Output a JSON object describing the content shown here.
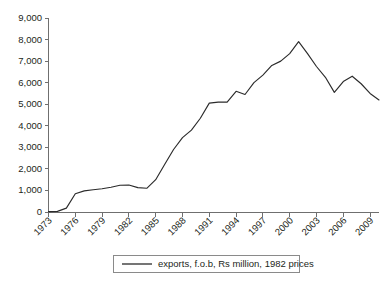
{
  "chart_data": {
    "type": "line",
    "title": "",
    "subtitle": "",
    "xlabel": "",
    "ylabel": "",
    "grid": false,
    "legend_position": "bottom",
    "xlim": [
      1973,
      2010
    ],
    "ylim": [
      0,
      9000
    ],
    "ytick_step": 1000,
    "ytick_labels": [
      "0",
      "1,000",
      "2,000",
      "3,000",
      "4,000",
      "5,000",
      "6,000",
      "7,000",
      "8,000",
      "9,000"
    ],
    "ytick_values": [
      0,
      1000,
      2000,
      3000,
      4000,
      5000,
      6000,
      7000,
      8000,
      9000
    ],
    "xtick_labels": [
      "1973",
      "1976",
      "1979",
      "1982",
      "1985",
      "1988",
      "1991",
      "1994",
      "1997",
      "2000",
      "2003",
      "2006",
      "2009"
    ],
    "xtick_values": [
      1973,
      1976,
      1979,
      1982,
      1985,
      1988,
      1991,
      1994,
      1997,
      2000,
      2003,
      2006,
      2009
    ],
    "series": [
      {
        "name": "exports, f.o.b, Rs million, 1982 prices",
        "color": "#2b2b2b",
        "x": [
          1973,
          1974,
          1975,
          1976,
          1977,
          1978,
          1979,
          1980,
          1981,
          1982,
          1983,
          1984,
          1985,
          1986,
          1987,
          1988,
          1989,
          1990,
          1991,
          1992,
          1993,
          1994,
          1995,
          1996,
          1997,
          1998,
          1999,
          2000,
          2001,
          2002,
          2003,
          2004,
          2005,
          2006,
          2007,
          2008,
          2009,
          2010
        ],
        "values": [
          20,
          30,
          180,
          850,
          980,
          1030,
          1080,
          1150,
          1240,
          1250,
          1130,
          1100,
          1500,
          2200,
          2900,
          3450,
          3800,
          4350,
          5050,
          5100,
          5100,
          5600,
          5450,
          6000,
          6350,
          6800,
          7000,
          7350,
          7900,
          7350,
          6750,
          6250,
          5550,
          6050,
          6300,
          5950,
          5500,
          5200
        ]
      }
    ],
    "legend": [
      {
        "label": "exports, f.o.b, Rs million, 1982 prices",
        "color": "#2b2b2b"
      }
    ]
  },
  "colors": {
    "axis": "#6f6f6f",
    "line": "#2b2b2b",
    "text": "#231f20",
    "background": "#ffffff",
    "legend_border": "#8a8a8a"
  }
}
